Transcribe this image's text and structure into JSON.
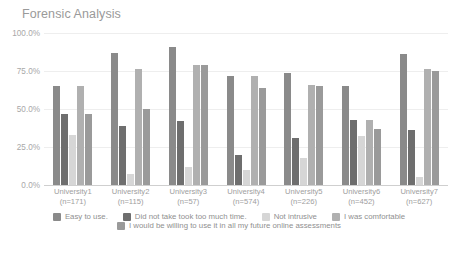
{
  "chart_data": {
    "type": "bar",
    "title": "Forensic Analysis",
    "xlabel": "",
    "ylabel": "",
    "ylim": [
      0,
      100
    ],
    "ytick_labels": [
      "0.0%",
      "25.0%",
      "50.0%",
      "75.0%",
      "100.0%"
    ],
    "ytick_values": [
      0,
      25,
      50,
      75,
      100
    ],
    "grid": true,
    "legend_position": "bottom",
    "categories": [
      "University1\n(n=171)",
      "University2\n(n=115)",
      "University3\n(n=57)",
      "University4\n(n=574)",
      "University5\n(n=226)",
      "University6\n(n=452)",
      "University7\n(n=627)"
    ],
    "category_names": [
      "University1",
      "University2",
      "University3",
      "University4",
      "University5",
      "University6",
      "University7"
    ],
    "category_counts": [
      "(n=171)",
      "(n=115)",
      "(n=57)",
      "(n=574)",
      "(n=226)",
      "(n=452)",
      "(n=627)"
    ],
    "series": [
      {
        "name": "Easy to use.",
        "color": "#8a8a8a",
        "values": [
          65,
          87,
          91,
          72,
          74,
          65,
          86
        ]
      },
      {
        "name": "Did not take took too much time.",
        "color": "#6e6e6e",
        "values": [
          47,
          39,
          42,
          20,
          31,
          43,
          36
        ]
      },
      {
        "name": "Not intrusive",
        "color": "#d6d6d6",
        "values": [
          33,
          7,
          12,
          10,
          18,
          32,
          5
        ]
      },
      {
        "name": "I was comfortable",
        "color": "#b0b0b0",
        "values": [
          65,
          76,
          79,
          72,
          66,
          43,
          76
        ]
      },
      {
        "name": "I would be willing to use it in all my future online assessments",
        "color": "#9a9a9a",
        "values": [
          47,
          50,
          79,
          64,
          65,
          37,
          75
        ]
      }
    ]
  },
  "colors": {
    "background": "#ffffff",
    "title_text": "#9a9a9a",
    "axis_text": "#a8a8a8",
    "gridline": "#eeeeee",
    "baseline": "#cfcfcf",
    "legend_text": "#8f8f8f"
  }
}
